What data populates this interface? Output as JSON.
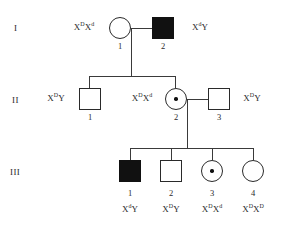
{
  "chart_data": {
    "type": "diagram",
    "notation": {
      "filled_square": "affected male",
      "open_square": "unaffected male",
      "open_circle": "unaffected female",
      "dotted_circle": "carrier female"
    },
    "generations": [
      {
        "label": "I",
        "individuals": [
          {
            "id": "1",
            "sex": "female",
            "status": "carrier-or-normal",
            "symbol": "open-circle",
            "genotype_html": "X<sup>D</sup>X<sup>d</sup>",
            "genotype_text": "XDXd",
            "genotype_side": "left"
          },
          {
            "id": "2",
            "sex": "male",
            "status": "affected",
            "symbol": "filled-square",
            "genotype_html": "X<sup>d</sup>Y",
            "genotype_text": "XdY",
            "genotype_side": "right"
          }
        ]
      },
      {
        "label": "II",
        "individuals": [
          {
            "id": "1",
            "sex": "male",
            "status": "unaffected",
            "symbol": "open-square",
            "genotype_html": "X<sup>D</sup>Y",
            "genotype_text": "XDY",
            "genotype_side": "left"
          },
          {
            "id": "2",
            "sex": "female",
            "status": "carrier",
            "symbol": "dotted-circle",
            "genotype_html": "X<sup>D</sup>X<sup>d</sup>",
            "genotype_text": "XDXd",
            "genotype_side": "left"
          },
          {
            "id": "3",
            "sex": "male",
            "status": "unaffected",
            "symbol": "open-square",
            "genotype_html": "X<sup>D</sup>Y",
            "genotype_text": "XDY",
            "genotype_side": "right"
          }
        ]
      },
      {
        "label": "III",
        "individuals": [
          {
            "id": "1",
            "sex": "male",
            "status": "affected",
            "symbol": "filled-square",
            "genotype_html": "X<sup>d</sup>Y",
            "genotype_text": "XdY",
            "genotype_side": "below"
          },
          {
            "id": "2",
            "sex": "male",
            "status": "unaffected",
            "symbol": "open-square",
            "genotype_html": "X<sup>D</sup>Y",
            "genotype_text": "XDY",
            "genotype_side": "below"
          },
          {
            "id": "3",
            "sex": "female",
            "status": "carrier",
            "symbol": "dotted-circle",
            "genotype_html": "X<sup>D</sup>X<sup>d</sup>",
            "genotype_text": "XDXd",
            "genotype_side": "below"
          },
          {
            "id": "4",
            "sex": "female",
            "status": "unaffected",
            "symbol": "open-circle",
            "genotype_html": "X<sup>D</sup>X<sup>D</sup>",
            "genotype_text": "XDXD",
            "genotype_side": "below"
          }
        ]
      }
    ],
    "matings": [
      {
        "parents": [
          "I-1",
          "I-2"
        ],
        "children": [
          "II-1",
          "II-2"
        ]
      },
      {
        "parents": [
          "II-2",
          "II-3"
        ],
        "children": [
          "III-1",
          "III-2",
          "III-3",
          "III-4"
        ]
      }
    ],
    "colors": {
      "affected_fill": "#111111",
      "line": "#3a3a3a",
      "symbol_outline": "#2a2a2a",
      "text": "#2a2a2a",
      "background": "#ffffff"
    }
  }
}
